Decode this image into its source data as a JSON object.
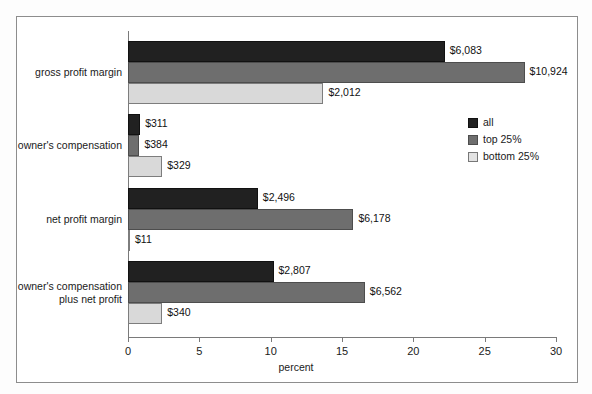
{
  "chart_data": {
    "type": "bar",
    "orientation": "horizontal",
    "title": "",
    "xlabel": "percent",
    "ylabel": "",
    "xlim": [
      0,
      30
    ],
    "xticks": [
      0,
      5,
      10,
      15,
      20,
      25,
      30
    ],
    "xtick_labels": [
      "0",
      "5",
      "10",
      "15",
      "20",
      "25",
      "30"
    ],
    "grid": false,
    "legend_position": "upper right inside",
    "categories": [
      "gross profit margin",
      "owner's compensation",
      "net profit margin",
      "owner's compensation\nplus net profit"
    ],
    "series": [
      {
        "name": "all",
        "color": "#212121",
        "values": [
          22.2,
          0.85,
          9.1,
          10.2
        ],
        "data_labels": [
          "$6,083",
          "$311",
          "$2,496",
          "$2,807"
        ]
      },
      {
        "name": "top 25%",
        "color": "#6e6e6e",
        "values": [
          27.8,
          0.8,
          15.8,
          16.6
        ],
        "data_labels": [
          "$10,924",
          "$384",
          "$6,178",
          "$6,562"
        ]
      },
      {
        "name": "bottom 25%",
        "color": "#d9d9d9",
        "values": [
          13.7,
          2.4,
          0.1,
          2.4
        ],
        "data_labels": [
          "$2,012",
          "$329",
          "$11",
          "$340"
        ]
      }
    ]
  },
  "axis": {
    "x_title": "percent",
    "ticks": [
      {
        "value": "0"
      },
      {
        "value": "5"
      },
      {
        "value": "10"
      },
      {
        "value": "15"
      },
      {
        "value": "20"
      },
      {
        "value": "25"
      },
      {
        "value": "30"
      }
    ]
  },
  "legend": {
    "items": [
      {
        "label": "all"
      },
      {
        "label": "top 25%"
      },
      {
        "label": "bottom 25%"
      }
    ]
  },
  "groups": [
    {
      "label": "gross profit margin",
      "bars": [
        {
          "series": "all",
          "value": 22.2,
          "label": "$6,083"
        },
        {
          "series": "top 25%",
          "value": 27.8,
          "label": "$10,924"
        },
        {
          "series": "bottom 25%",
          "value": 13.7,
          "label": "$2,012"
        }
      ]
    },
    {
      "label": "owner's compensation",
      "bars": [
        {
          "series": "all",
          "value": 0.85,
          "label": "$311"
        },
        {
          "series": "top 25%",
          "value": 0.8,
          "label": "$384"
        },
        {
          "series": "bottom 25%",
          "value": 2.4,
          "label": "$329"
        }
      ]
    },
    {
      "label": "net profit margin",
      "bars": [
        {
          "series": "all",
          "value": 9.1,
          "label": "$2,496"
        },
        {
          "series": "top 25%",
          "value": 15.8,
          "label": "$6,178"
        },
        {
          "series": "bottom 25%",
          "value": 0.1,
          "label": "$11"
        }
      ]
    },
    {
      "label": "owner's compensation\nplus net profit",
      "bars": [
        {
          "series": "all",
          "value": 10.2,
          "label": "$2,807"
        },
        {
          "series": "top 25%",
          "value": 16.6,
          "label": "$6,562"
        },
        {
          "series": "bottom 25%",
          "value": 2.4,
          "label": "$340"
        }
      ]
    }
  ]
}
